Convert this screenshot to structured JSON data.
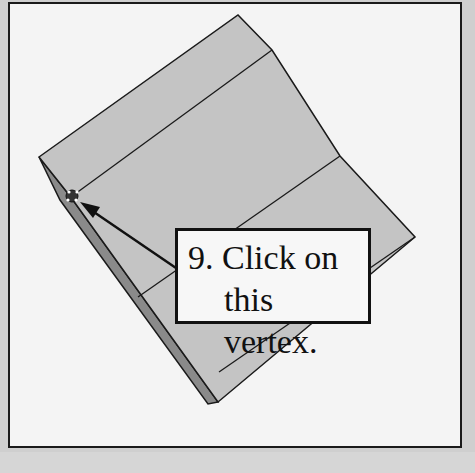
{
  "callout": {
    "line1": "9. Click on",
    "line2": "this vertex."
  },
  "colors": {
    "face": "#c4c4c4",
    "edge_face": "#8a8a8a",
    "outline": "#1a1a1a",
    "background": "#f4f4f4"
  }
}
